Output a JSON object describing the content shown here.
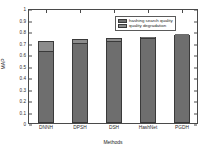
{
  "chart_data": {
    "type": "bar",
    "subtype": "stacked-bar",
    "title": "",
    "xlabel": "Methods",
    "ylabel": "MAP",
    "categories": [
      "DNNH",
      "DPSH",
      "DSH",
      "HashNet",
      "PGDH"
    ],
    "ylim": [
      0,
      1
    ],
    "ytick_labels": [
      "0",
      "0.1",
      "0.2",
      "0.3",
      "0.4",
      "0.5",
      "0.6",
      "0.7",
      "0.8",
      "0.9",
      "1"
    ],
    "ytick_values": [
      0,
      0.1,
      0.2,
      0.3,
      0.4,
      0.5,
      0.6,
      0.7,
      0.8,
      0.9,
      1
    ],
    "grid": false,
    "legend_position": "top-right",
    "series": [
      {
        "name": "hashing search quality",
        "color": "#6e6e6e",
        "values": [
          0.63,
          0.7,
          0.715,
          0.74,
          0.765
        ]
      },
      {
        "name": "quality degradation",
        "color": "#8c8c8c",
        "values": [
          0.085,
          0.03,
          0.02,
          0.01,
          0.0
        ]
      }
    ],
    "totals": [
      0.715,
      0.73,
      0.735,
      0.75,
      0.765
    ]
  },
  "legend": {
    "items": [
      {
        "label": "hashing search quality",
        "color": "#6e6e6e"
      },
      {
        "label": "quality degradation",
        "color": "#8c8c8c"
      }
    ]
  },
  "axes": {
    "x_axis_label": "Methods",
    "y_axis_label": "MAP"
  },
  "colors": {
    "axis": "#4a4a4a",
    "bar_base": "#6e6e6e",
    "bar_top": "#8c8c8c",
    "background": "#ffffff",
    "text": "#1c1c1c"
  }
}
